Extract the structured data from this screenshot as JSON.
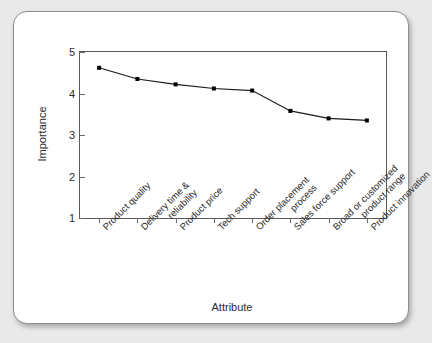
{
  "chart_data": {
    "type": "line",
    "title": "",
    "xlabel": "Attribute",
    "ylabel": "Importance",
    "categories": [
      "Product quality",
      "Delivery time & reliability",
      "Product price",
      "Tech support",
      "Order placement process",
      "Sales force support",
      "Broad or customized product range",
      "Product innovation"
    ],
    "values": [
      4.62,
      4.35,
      4.22,
      4.12,
      4.07,
      3.58,
      3.4,
      3.35
    ],
    "ylim": [
      1,
      5
    ],
    "yticks": [
      1,
      2,
      3,
      4,
      5
    ],
    "ytick_labels": [
      "1",
      "2",
      "3",
      "4",
      "5"
    ],
    "grid": false,
    "legend": "none",
    "marker": "filled-square",
    "line_color": "#1a1a1a",
    "marker_color": "#000000"
  },
  "colors": {
    "page_background": "#e9e9e9",
    "card_background": "#ffffff",
    "card_border": "#8d8d8d",
    "axis": "#5a5a5a",
    "text": "#2b2b2b"
  }
}
